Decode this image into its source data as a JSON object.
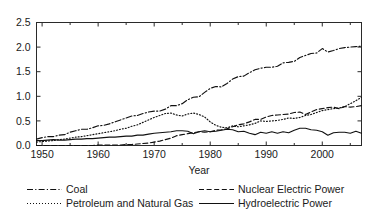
{
  "chart_data": {
    "type": "line",
    "title": "",
    "xlabel": "Year",
    "ylabel": "",
    "xlim": [
      1949,
      2007
    ],
    "ylim": [
      0.0,
      2.5
    ],
    "grid": false,
    "legend_position": "below",
    "xticks": [
      1950,
      1960,
      1970,
      1980,
      1990,
      2000
    ],
    "xtick_labels": [
      "1950",
      "1960",
      "1970",
      "1980",
      "1990",
      "2000"
    ],
    "yticks": [
      0.0,
      0.5,
      1.0,
      1.5,
      2.0,
      2.5
    ],
    "ytick_labels": [
      "0.0",
      "0.5",
      "1.0",
      "1.5",
      "2.0",
      "2.5"
    ],
    "x": [
      1949,
      1950,
      1951,
      1952,
      1953,
      1954,
      1955,
      1956,
      1957,
      1958,
      1959,
      1960,
      1961,
      1962,
      1963,
      1964,
      1965,
      1966,
      1967,
      1968,
      1969,
      1970,
      1971,
      1972,
      1973,
      1974,
      1975,
      1976,
      1977,
      1978,
      1979,
      1980,
      1981,
      1982,
      1983,
      1984,
      1985,
      1986,
      1987,
      1988,
      1989,
      1990,
      1991,
      1992,
      1993,
      1994,
      1995,
      1996,
      1997,
      1998,
      1999,
      2000,
      2001,
      2002,
      2003,
      2004,
      2005,
      2006,
      2007
    ],
    "series": [
      {
        "name": "Coal",
        "linestyle": "dashdot",
        "values": [
          0.13,
          0.16,
          0.18,
          0.18,
          0.21,
          0.22,
          0.27,
          0.3,
          0.33,
          0.33,
          0.36,
          0.4,
          0.41,
          0.44,
          0.48,
          0.52,
          0.56,
          0.6,
          0.61,
          0.65,
          0.68,
          0.7,
          0.7,
          0.74,
          0.81,
          0.81,
          0.85,
          0.93,
          0.98,
          0.99,
          1.08,
          1.16,
          1.2,
          1.19,
          1.26,
          1.35,
          1.4,
          1.41,
          1.48,
          1.54,
          1.57,
          1.59,
          1.59,
          1.61,
          1.68,
          1.69,
          1.71,
          1.79,
          1.83,
          1.87,
          1.88,
          1.97,
          1.9,
          1.93,
          1.97,
          1.99,
          2.0,
          2.01,
          2.02
        ]
      },
      {
        "name": "Petroleum and Natural Gas",
        "linestyle": "dotted",
        "values": [
          0.07,
          0.08,
          0.09,
          0.1,
          0.12,
          0.13,
          0.15,
          0.17,
          0.18,
          0.2,
          0.22,
          0.24,
          0.26,
          0.28,
          0.3,
          0.33,
          0.35,
          0.39,
          0.42,
          0.47,
          0.52,
          0.57,
          0.61,
          0.65,
          0.66,
          0.62,
          0.6,
          0.64,
          0.66,
          0.63,
          0.58,
          0.48,
          0.41,
          0.37,
          0.36,
          0.4,
          0.38,
          0.4,
          0.42,
          0.45,
          0.5,
          0.49,
          0.5,
          0.51,
          0.53,
          0.56,
          0.55,
          0.57,
          0.61,
          0.63,
          0.67,
          0.71,
          0.73,
          0.75,
          0.76,
          0.79,
          0.85,
          0.91,
          0.98
        ]
      },
      {
        "name": "Nuclear Electric Power",
        "linestyle": "dashed",
        "values": [
          0.0,
          0.0,
          0.0,
          0.0,
          0.0,
          0.0,
          0.0,
          0.0,
          0.0,
          0.0,
          0.0,
          0.01,
          0.01,
          0.01,
          0.01,
          0.01,
          0.02,
          0.02,
          0.03,
          0.04,
          0.05,
          0.07,
          0.09,
          0.12,
          0.15,
          0.2,
          0.22,
          0.24,
          0.26,
          0.28,
          0.27,
          0.28,
          0.31,
          0.32,
          0.34,
          0.38,
          0.42,
          0.44,
          0.48,
          0.53,
          0.53,
          0.58,
          0.61,
          0.62,
          0.63,
          0.64,
          0.67,
          0.68,
          0.63,
          0.68,
          0.73,
          0.75,
          0.77,
          0.78,
          0.75,
          0.79,
          0.78,
          0.79,
          0.81
        ]
      },
      {
        "name": "Hydroelectric Power",
        "linestyle": "solid",
        "values": [
          0.1,
          0.1,
          0.11,
          0.12,
          0.11,
          0.11,
          0.12,
          0.13,
          0.13,
          0.14,
          0.14,
          0.15,
          0.16,
          0.17,
          0.17,
          0.18,
          0.19,
          0.19,
          0.21,
          0.21,
          0.23,
          0.25,
          0.26,
          0.27,
          0.28,
          0.3,
          0.3,
          0.29,
          0.24,
          0.28,
          0.3,
          0.28,
          0.29,
          0.31,
          0.33,
          0.32,
          0.28,
          0.29,
          0.25,
          0.22,
          0.27,
          0.25,
          0.28,
          0.25,
          0.28,
          0.26,
          0.31,
          0.35,
          0.35,
          0.32,
          0.31,
          0.28,
          0.21,
          0.26,
          0.27,
          0.27,
          0.25,
          0.29,
          0.25
        ]
      }
    ]
  },
  "legend": {
    "items": [
      {
        "label": "Coal",
        "style": "dashdot"
      },
      {
        "label": "Nuclear Electric Power",
        "style": "dashed"
      },
      {
        "label": "Petroleum and Natural Gas",
        "style": "dotted"
      },
      {
        "label": "Hydroelectric Power",
        "style": "solid"
      }
    ]
  }
}
